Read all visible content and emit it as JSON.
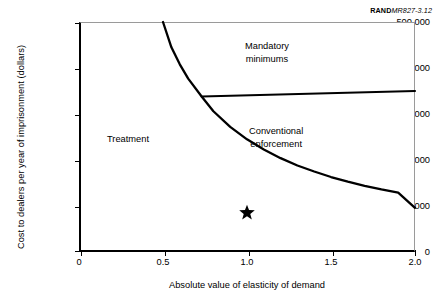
{
  "source_credit": {
    "brand": "RAND",
    "doc_id": "MR827-3.12"
  },
  "chart_data": {
    "type": "line",
    "title": "",
    "subtitle": "",
    "xlabel": "Absolute value of elasticity of demand",
    "ylabel": "Cost to dealers per year of imprisonment (dollars)",
    "xlim": [
      0,
      2.0
    ],
    "ylim": [
      0,
      500000
    ],
    "xticks": [
      0,
      0.5,
      1.0,
      1.5,
      2.0
    ],
    "xtick_labels": [
      "0",
      "0.5",
      "1.0",
      "1.5",
      "2.0"
    ],
    "yticks": [
      0,
      100000,
      200000,
      300000,
      400000,
      500000
    ],
    "ytick_labels": [
      "0",
      "100,000",
      "200,000",
      "300,000",
      "400,000",
      "500,000"
    ],
    "grid": false,
    "legend": "none",
    "series": [
      {
        "name": "treatment-vs-enforcement-boundary",
        "type": "curve",
        "description": "Hyperbolic boundary y = 245000 / x separating Treatment (left) from enforcement regions (right)",
        "points": [
          {
            "x": 0.5,
            "y": 500000
          },
          {
            "x": 0.55,
            "y": 445000
          },
          {
            "x": 0.6,
            "y": 408000
          },
          {
            "x": 0.65,
            "y": 377000
          },
          {
            "x": 0.73,
            "y": 338000
          },
          {
            "x": 0.8,
            "y": 306000
          },
          {
            "x": 0.9,
            "y": 272000
          },
          {
            "x": 1.0,
            "y": 245000
          },
          {
            "x": 1.1,
            "y": 223000
          },
          {
            "x": 1.2,
            "y": 204000
          },
          {
            "x": 1.3,
            "y": 188000
          },
          {
            "x": 1.4,
            "y": 175000
          },
          {
            "x": 1.5,
            "y": 163000
          },
          {
            "x": 1.6,
            "y": 153000
          },
          {
            "x": 1.7,
            "y": 144000
          },
          {
            "x": 1.8,
            "y": 136000
          },
          {
            "x": 1.9,
            "y": 129000
          },
          {
            "x": 2.0,
            "y": 96000
          }
        ]
      },
      {
        "name": "mandatory-minimums-boundary",
        "type": "line",
        "description": "Near-horizontal boundary separating Mandatory minimums (above) from Conventional enforcement (below)",
        "points": [
          {
            "x": 0.73,
            "y": 338000
          },
          {
            "x": 2.0,
            "y": 350000
          }
        ]
      }
    ],
    "markers": [
      {
        "name": "current-policy-point",
        "symbol": "star",
        "x": 1.0,
        "y": 85000,
        "color": "#000000"
      }
    ],
    "annotations": [
      {
        "name": "treatment",
        "text": "Treatment",
        "x": 0.33,
        "y": 250000
      },
      {
        "name": "mandatory-minimums",
        "text": "Mandatory\nminimums",
        "x": 1.32,
        "y": 452000
      },
      {
        "name": "conventional-enforcement",
        "text": "Conventional\nenforcement",
        "x": 1.36,
        "y": 270000
      }
    ]
  },
  "labels": {
    "treatment": "Treatment",
    "mandatory_minimums_line1": "Mandatory",
    "mandatory_minimums_line2": "minimums",
    "conventional_enforcement_line1": "Conventional",
    "conventional_enforcement_line2": "enforcement"
  },
  "colors": {
    "axis": "#000000",
    "curve": "#000000",
    "frame_light": "#9a9a9a",
    "background": "#ffffff"
  }
}
